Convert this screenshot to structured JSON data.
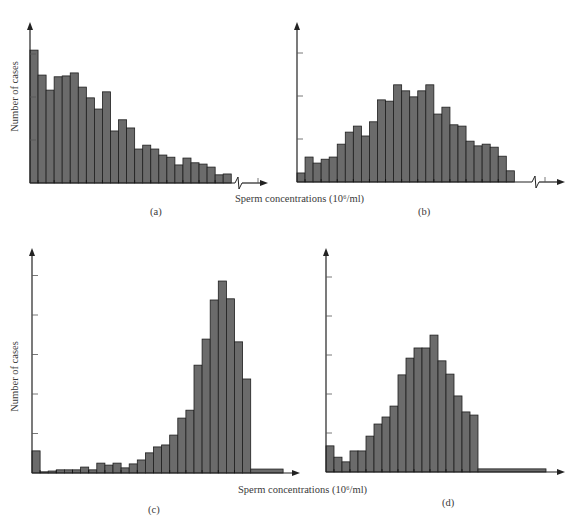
{
  "figure": {
    "xlabel": "Sperm concentrations (10⁶/ml)",
    "ylabel": "Number of cases",
    "bar_color": "#6b6b6b",
    "bar_edge": "#1e1e1e",
    "axis_color": "#222222"
  },
  "chart_data": [
    {
      "panel": "(a)",
      "type": "bar",
      "title": "",
      "xlabel": "Sperm concentrations (10⁶/ml)",
      "ylabel": "Number of cases",
      "y_units": "tick intervals (unlabeled ticks)",
      "ylim": [
        0,
        3.6
      ],
      "y_ticks": [
        1,
        2,
        3
      ],
      "x_tick_labels": [],
      "axis_break": true,
      "grid": false,
      "values": [
        3.09,
        2.51,
        2.16,
        2.47,
        2.49,
        2.56,
        2.23,
        1.98,
        1.72,
        2.12,
        1.21,
        1.47,
        1.28,
        0.79,
        0.88,
        0.79,
        0.65,
        0.6,
        0.42,
        0.58,
        0.47,
        0.44,
        0.37,
        0.19,
        0.21
      ]
    },
    {
      "panel": "(b)",
      "type": "bar",
      "title": "",
      "xlabel": "Sperm concentrations (10⁶/ml)",
      "ylabel": "",
      "y_units": "tick intervals (unlabeled ticks)",
      "ylim": [
        0,
        3.6
      ],
      "y_ticks": [
        1,
        2,
        3
      ],
      "x_tick_labels": [],
      "axis_break": true,
      "grid": false,
      "values": [
        0.21,
        0.58,
        0.44,
        0.53,
        0.58,
        0.88,
        1.16,
        1.3,
        1.07,
        1.4,
        1.91,
        1.88,
        2.26,
        2.12,
        1.98,
        2.12,
        2.26,
        1.58,
        1.74,
        1.33,
        1.3,
        0.95,
        0.84,
        0.88,
        0.81,
        0.6,
        0.26
      ]
    },
    {
      "panel": "(c)",
      "type": "bar",
      "title": "",
      "xlabel": "Sperm concentrations (10⁶/ml)",
      "ylabel": "Number of cases",
      "y_units": "tick intervals (unlabeled ticks)",
      "ylim": [
        0,
        5.6
      ],
      "y_ticks": [
        1,
        2,
        3,
        4,
        5
      ],
      "x_tick_labels": [],
      "axis_break": false,
      "grid": false,
      "values": [
        0.56,
        0.03,
        0.05,
        0.08,
        0.08,
        0.08,
        0.15,
        0.08,
        0.25,
        0.2,
        0.25,
        0.13,
        0.23,
        0.33,
        0.51,
        0.66,
        0.71,
        0.96,
        1.39,
        1.59,
        2.73,
        3.39,
        4.38,
        4.86,
        4.41,
        3.32,
        2.38
      ],
      "tail": {
        "height": 0.1,
        "width_bins": 4
      }
    },
    {
      "panel": "(d)",
      "type": "bar",
      "title": "",
      "xlabel": "Sperm concentrations (10⁶/ml)",
      "ylabel": "",
      "y_units": "tick intervals (unlabeled ticks)",
      "ylim": [
        0,
        5.6
      ],
      "y_ticks": [
        1,
        2,
        3,
        4,
        5
      ],
      "x_tick_labels": [],
      "axis_break": false,
      "grid": false,
      "values": [
        0.67,
        0.38,
        0.26,
        0.54,
        0.54,
        0.92,
        1.23,
        1.41,
        1.69,
        2.49,
        2.92,
        3.18,
        3.18,
        3.51,
        2.85,
        2.51,
        1.95,
        1.54,
        1.46
      ],
      "tail": {
        "height": 0.08,
        "width_bins": 8.5
      }
    }
  ],
  "panels": {
    "a": {
      "caption": "(a)"
    },
    "b": {
      "caption": "(b)"
    },
    "c": {
      "caption": "(c)"
    },
    "d": {
      "caption": "(d)"
    }
  }
}
